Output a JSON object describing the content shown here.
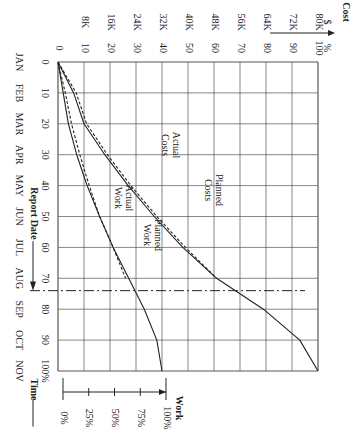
{
  "figure": {
    "label": "FIGURE 9.6",
    "orientation": "rotated 90deg clockwise"
  },
  "axes": {
    "cost_title": "Cost",
    "cost_dollar_symbol": "$",
    "cost_percent_symbol": "%",
    "cost_dollar_ticks": [
      "8K",
      "16K",
      "24K",
      "32K",
      "40K",
      "48K",
      "56K",
      "64K",
      "72K",
      "80K"
    ],
    "cost_percent_ticks": [
      "0",
      "10",
      "20",
      "30",
      "40",
      "50",
      "60",
      "70",
      "80",
      "90",
      "100"
    ],
    "time_percent_ticks": [
      "0",
      "10",
      "20",
      "30",
      "40",
      "50",
      "60",
      "70",
      "80",
      "90",
      "100%"
    ],
    "months": [
      "JAN",
      "FEB",
      "MAR",
      "APR",
      "MAY",
      "JUN",
      "JUL",
      "AUG",
      "SEP",
      "OCT",
      "NOV"
    ],
    "time_title": "Time",
    "report_date_label": "Report Date",
    "work_title": "Work",
    "work_ticks": [
      "0%",
      "25%",
      "50%",
      "75%",
      "100%"
    ]
  },
  "annotations": {
    "actual_costs": [
      "Actual",
      "Costs"
    ],
    "planned_costs": [
      "Planned",
      "Costs"
    ],
    "actual_work": [
      "Actual",
      "Work"
    ],
    "planned_work": [
      "Planned",
      "Work"
    ]
  },
  "chart_data": {
    "type": "line",
    "xlabel": "Time (%) / Months JAN–NOV",
    "ylabel": "Cost (% and $, 100% = $80K); Work (% on separate scale)",
    "x": [
      0,
      10,
      20,
      30,
      40,
      50,
      60,
      70,
      80,
      90,
      100
    ],
    "series": [
      {
        "name": "Planned Costs",
        "style": "solid",
        "values": [
          0,
          6,
          10,
          18,
          27,
          37,
          48,
          61,
          79,
          93,
          100
        ]
      },
      {
        "name": "Actual Costs",
        "style": "dashed",
        "values": [
          0,
          7,
          11,
          19,
          28,
          38,
          49,
          61,
          null,
          null,
          null
        ]
      },
      {
        "name": "Planned Work (%)",
        "style": "solid",
        "values": [
          0,
          5,
          10,
          18,
          28,
          40,
          53,
          68,
          83,
          95,
          100
        ]
      },
      {
        "name": "Actual Work (%)",
        "style": "dashed",
        "values": [
          0,
          7,
          13,
          21,
          30,
          40,
          53,
          65,
          null,
          null,
          null
        ]
      }
    ],
    "report_date_time_pct": 74,
    "ylim": [
      0,
      100
    ],
    "grid": true
  }
}
